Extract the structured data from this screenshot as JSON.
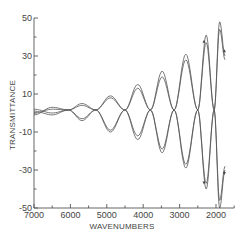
{
  "chart_data": {
    "type": "line",
    "title": "",
    "xlabel": "WAVENUMBERS",
    "ylabel": "TRANSMITTANCE",
    "xlim": [
      7000,
      1500
    ],
    "ylim": [
      -50,
      50
    ],
    "x_reversed": true,
    "grid": false,
    "legend": null,
    "x_ticks": [
      7000,
      6000,
      5000,
      4000,
      3000,
      2000
    ],
    "x_tick_labels": [
      "7000",
      "6000",
      "5000",
      "4000",
      "3000",
      "2000"
    ],
    "x_minor_ticks": [
      6500,
      5500,
      4500,
      3500,
      2500,
      1500
    ],
    "y_ticks": [
      50,
      30,
      10,
      -10,
      -30,
      -50
    ],
    "y_tick_labels": [
      "50",
      "30",
      "10",
      "-10",
      "-30",
      "-50"
    ],
    "y_minor_ticks": [
      40,
      20,
      0,
      -20,
      -40
    ],
    "node_wavenumbers": [
      6050,
      5300,
      4500,
      3800,
      3150,
      2500,
      2050
    ],
    "node_value": 1.6,
    "series": [
      {
        "name": "trace-1",
        "x": [
          7000,
          6500,
          6050,
          5680,
          5300,
          4900,
          4500,
          4150,
          3800,
          3480,
          3150,
          2830,
          2500,
          2270,
          2050,
          1900,
          1750
        ],
        "y": [
          1,
          -1,
          1.6,
          5,
          1.6,
          -10,
          1.6,
          15,
          1.6,
          -21,
          1.6,
          31,
          1.6,
          -40,
          1.6,
          48,
          30
        ]
      },
      {
        "name": "trace-2",
        "x": [
          7000,
          6500,
          6050,
          5680,
          5300,
          4900,
          4500,
          4150,
          3800,
          3480,
          3150,
          2830,
          2500,
          2270,
          2050,
          1900,
          1750
        ],
        "y": [
          2,
          0,
          1.6,
          4,
          1.6,
          -9,
          1.6,
          13,
          1.6,
          -19,
          1.6,
          28,
          1.6,
          -37,
          1.6,
          44,
          28
        ]
      },
      {
        "name": "trace-3",
        "x": [
          7000,
          6500,
          6050,
          5680,
          5300,
          4900,
          4500,
          4150,
          3800,
          3480,
          3150,
          2830,
          2500,
          2270,
          2050,
          1900,
          1750
        ],
        "y": [
          -1,
          3,
          1.6,
          -4,
          1.6,
          9,
          1.6,
          -14,
          1.6,
          22,
          1.6,
          -29,
          1.6,
          41,
          1.6,
          -50,
          -30
        ]
      },
      {
        "name": "trace-4",
        "x": [
          7000,
          6500,
          6050,
          5680,
          5300,
          4900,
          4500,
          4150,
          3800,
          3480,
          3150,
          2830,
          2500,
          2270,
          2050,
          1900,
          1750
        ],
        "y": [
          0,
          2,
          1.6,
          -3,
          1.6,
          8,
          1.6,
          -12,
          1.6,
          19,
          1.6,
          -27,
          1.6,
          37,
          1.6,
          -46,
          -28
        ]
      }
    ],
    "annotations": [
      "small arrowheads near 2300 cm-1 on upper and lower lobes"
    ]
  },
  "style": {
    "line_color": "#555555",
    "background": "#ffffff",
    "text_color": "#444444"
  }
}
